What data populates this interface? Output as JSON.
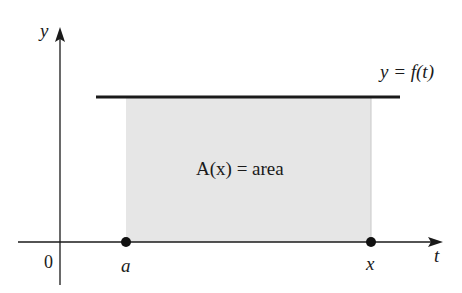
{
  "diagram": {
    "axis_y_label": "y",
    "axis_t_label": "t",
    "origin_label": "0",
    "point_a_label": "a",
    "point_x_label": "x",
    "curve_label": "y = f(t)",
    "region_label": "A(x) = area"
  },
  "colors": {
    "axis": "#1a1a1a",
    "curve": "#1a1a1a",
    "region_fill": "#e6e6e6",
    "point": "#111111"
  }
}
